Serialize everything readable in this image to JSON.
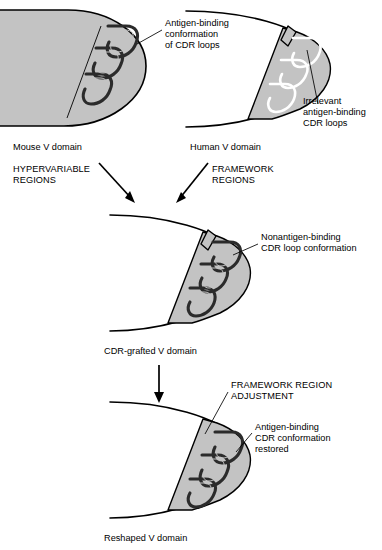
{
  "figure": {
    "background_color": "#ffffff",
    "domain_fill_color": "#c3c3c3",
    "loop_color": "#2b2b2b",
    "outline_color": "#000000"
  },
  "panels": {
    "mouse": {
      "caption": "Mouse V domain",
      "annotation": {
        "line1": "Antigen-binding",
        "line2": "conformation",
        "line3": "of CDR loops"
      },
      "loop_style": "dark-filled",
      "domain_shading": "filled-gray"
    },
    "human": {
      "caption": "Human V domain",
      "annotation": {
        "line1": "Irrelevant",
        "line2": "antigen-binding",
        "line3": "CDR loops"
      },
      "loop_style": "white-outlined",
      "domain_shading": "outline-with-gray-patch"
    },
    "grafted": {
      "caption": "CDR-grafted V domain",
      "annotation": {
        "line1": "Nonantigen-binding",
        "line2": "CDR loop conformation"
      },
      "loop_style": "dark-filled",
      "domain_shading": "outline-with-gray-patch"
    },
    "reshaped": {
      "caption": "Reshaped V domain",
      "annotation": {
        "line1": "Antigen-binding",
        "line2": "CDR conformation",
        "line3": "restored"
      },
      "loop_style": "dark-filled",
      "domain_shading": "outline-with-gray-patch"
    }
  },
  "process_labels": {
    "hypervariable": {
      "line1": "HYPERVARIABLE",
      "line2": "REGIONS"
    },
    "framework": {
      "line1": "FRAMEWORK",
      "line2": "REGIONS"
    },
    "framework_adjustment": {
      "line1": "FRAMEWORK REGION",
      "line2": "ADJUSTMENT"
    }
  },
  "arrows": [
    {
      "name": "hypervariable-to-grafted",
      "direction": "diagonal-down-right",
      "from": "mouse",
      "to": "grafted"
    },
    {
      "name": "framework-to-grafted",
      "direction": "diagonal-down-left",
      "from": "human",
      "to": "grafted"
    },
    {
      "name": "grafted-to-reshaped",
      "direction": "down",
      "from": "grafted",
      "to": "reshaped"
    }
  ]
}
